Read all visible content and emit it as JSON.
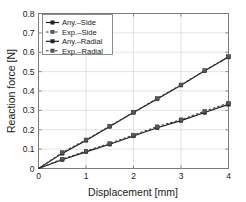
{
  "chart_data": {
    "type": "line",
    "title": "",
    "xlabel": "Displacement [mm]",
    "ylabel": "Reaction force [N]",
    "xlim": [
      0,
      4
    ],
    "ylim": [
      0,
      0.8
    ],
    "grid": true,
    "legend_position": "upper-left",
    "xticks": [
      "0",
      "1",
      "2",
      "3",
      "4"
    ],
    "xtick_values": [
      0,
      1,
      2,
      3,
      4
    ],
    "yticks": [
      "0",
      "0.1",
      "0.2",
      "0.3",
      "0.4",
      "0.5",
      "0.6",
      "0.7",
      "0.8"
    ],
    "ytick_values": [
      0,
      0.1,
      0.2,
      0.3,
      0.4,
      0.5,
      0.6,
      0.7,
      0.8
    ],
    "x": [
      0,
      0.5,
      1,
      1.5,
      2,
      2.5,
      3,
      3.5,
      4
    ],
    "series": [
      {
        "name": "Any.-Side",
        "style": "solid",
        "marker": "square",
        "color": "#1a1a1a",
        "values": [
          0,
          0.078,
          0.145,
          0.217,
          0.289,
          0.359,
          0.43,
          0.504,
          0.575
        ]
      },
      {
        "name": "Exp.-Side",
        "style": "dashed",
        "marker": "square",
        "color": "#3d3d3d",
        "values": [
          0,
          0.083,
          0.148,
          0.219,
          0.291,
          0.362,
          0.432,
          0.506,
          0.578
        ]
      },
      {
        "name": "Any.-Radial",
        "style": "solid",
        "marker": "square",
        "color": "#1a1a1a",
        "values": [
          0,
          0.045,
          0.086,
          0.125,
          0.168,
          0.21,
          0.247,
          0.289,
          0.331
        ]
      },
      {
        "name": "Exp.-Radial",
        "style": "dashed",
        "marker": "square",
        "color": "#3d3d3d",
        "values": [
          0,
          0.049,
          0.09,
          0.13,
          0.173,
          0.216,
          0.252,
          0.296,
          0.338
        ]
      }
    ]
  },
  "legend": {
    "entries": [
      {
        "label": "Any.–Side"
      },
      {
        "label": "Exp.–Side"
      },
      {
        "label": "Any.–Radial"
      },
      {
        "label": "Exp.–Radial"
      }
    ]
  },
  "axes": {
    "x_title": "Displacement [mm]",
    "y_title": "Reaction force [N]"
  }
}
